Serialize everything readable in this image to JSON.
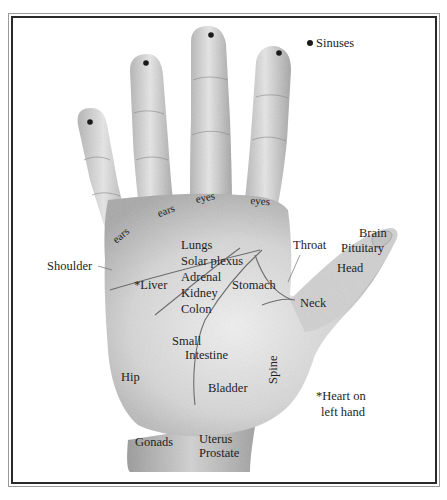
{
  "diagram": {
    "legend": {
      "dot_label": "Sinuses",
      "note_line1": "*Heart on",
      "note_line2": "left hand"
    },
    "labels": {
      "ears_1": "ears",
      "ears_2": "ears",
      "eyes_1": "eyes",
      "eyes_2": "eyes",
      "shoulder": "Shoulder",
      "liver": "*Liver",
      "lungs": "Lungs",
      "solar_plexus": "Solar plexus",
      "adrenal": "Adrenal",
      "kidney": "Kidney",
      "colon": "Colon",
      "stomach": "Stomach",
      "throat": "Throat",
      "brain": "Brain",
      "pituitary": "Pituitary",
      "head": "Head",
      "neck": "Neck",
      "small": "Small",
      "intestine": "Intestine",
      "spine": "Spine",
      "hip": "Hip",
      "bladder": "Bladder",
      "gonads": "Gonads",
      "uterus": "Uterus",
      "prostate": "Prostate"
    },
    "colors": {
      "frame": "#2a2a2a",
      "skin_light": "#e8e8e8",
      "skin_mid": "#cfcfcf",
      "skin_shadow": "#a8a8a8",
      "text": "#1e1e1e"
    }
  }
}
